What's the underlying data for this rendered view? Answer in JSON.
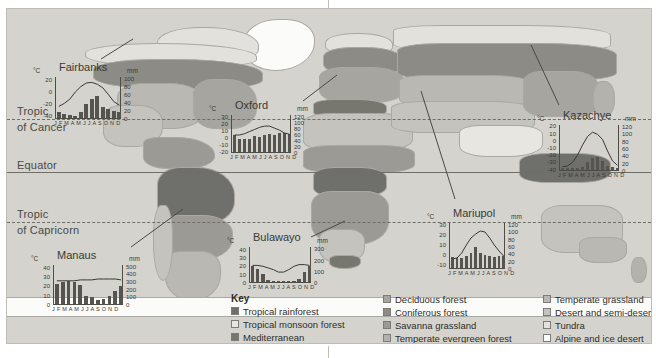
{
  "figure": {
    "background_color": "#d9d8d3",
    "latitude_labels": [
      {
        "name": "tropic-of-cancer",
        "line1": "Tropic",
        "line2": "of Cancer"
      },
      {
        "name": "equator",
        "line1": "Equator",
        "line2": ""
      },
      {
        "name": "tropic-of-capricorn",
        "line1": "Tropic",
        "line2": "of Capricorn"
      }
    ]
  },
  "key": {
    "title": "Key",
    "columns": [
      [
        {
          "label": "Tropical rainforest",
          "color": "#6f6f6c"
        },
        {
          "label": "Tropical monsoon forest",
          "color": "#e7e6e1"
        },
        {
          "label": "Mediterranean",
          "color": "#77776f"
        }
      ],
      [
        {
          "label": "Deciduous forest",
          "color": "#a6a5a0"
        },
        {
          "label": "Coniferous forest",
          "color": "#8c8b86"
        },
        {
          "label": "Savanna grassland",
          "color": "#9b9a95"
        },
        {
          "label": "Temperate evergreen forest",
          "color": "#b3b2ad"
        }
      ],
      [
        {
          "label": "Temperate grassland",
          "color": "#b9b8b3"
        },
        {
          "label": "Desert and semi-desert",
          "color": "#c4c3be"
        },
        {
          "label": "Tundra",
          "color": "#e2e1dc"
        },
        {
          "label": "Alpine and ice desert",
          "color": "#fbfbf9"
        }
      ]
    ]
  },
  "chart_data": [
    {
      "name": "fairbanks",
      "type": "bar",
      "title": "Fairbanks",
      "ylabel": "°C",
      "ylabel_right": "mm",
      "categories": [
        "J",
        "F",
        "M",
        "A",
        "M",
        "J",
        "J",
        "A",
        "S",
        "O",
        "N",
        "D"
      ],
      "months_label": "J F M A M J J A S O N D",
      "temp_ticks": [
        20,
        0,
        -20,
        -40
      ],
      "temp_ylim": [
        -45,
        25
      ],
      "precip_ticks": [
        100,
        80,
        60,
        40,
        20,
        0
      ],
      "precip_ylim": [
        0,
        105
      ],
      "temperature": [
        -24,
        -19,
        -12,
        0,
        9,
        15,
        16,
        13,
        7,
        -4,
        -16,
        -22
      ],
      "precipitation": [
        14,
        10,
        8,
        6,
        15,
        35,
        47,
        55,
        28,
        22,
        17,
        15
      ]
    },
    {
      "name": "oxford",
      "type": "bar",
      "title": "Oxford",
      "ylabel": "°C",
      "ylabel_right": "mm",
      "categories": [
        "J",
        "F",
        "M",
        "A",
        "M",
        "J",
        "J",
        "A",
        "S",
        "O",
        "N",
        "D"
      ],
      "months_label": "J F M A M J J A S O N D",
      "temp_ticks": [
        30,
        20,
        10,
        0,
        -10,
        -20
      ],
      "temp_ylim": [
        -22,
        33
      ],
      "precip_ticks": [
        120,
        100,
        80,
        60,
        40,
        20,
        0
      ],
      "precip_ylim": [
        0,
        125
      ],
      "temperature": [
        4,
        4,
        6,
        9,
        12,
        15,
        17,
        17,
        14,
        11,
        7,
        5
      ],
      "precipitation": [
        56,
        42,
        43,
        44,
        52,
        50,
        55,
        58,
        55,
        61,
        62,
        58
      ]
    },
    {
      "name": "kazachye",
      "type": "bar",
      "title": "Kazachye",
      "ylabel": "°C",
      "ylabel_right": "mm",
      "categories": [
        "J",
        "F",
        "M",
        "A",
        "M",
        "J",
        "J",
        "A",
        "S",
        "O",
        "N",
        "D"
      ],
      "months_label": "J F M A M J J A S O N D",
      "temp_ticks": [
        20,
        10,
        0,
        -10,
        -20,
        -30,
        -40
      ],
      "temp_ylim": [
        -42,
        22
      ],
      "precip_ticks": [
        120,
        100,
        80,
        60,
        40,
        20,
        0
      ],
      "precip_ylim": [
        0,
        125
      ],
      "temperature": [
        -36,
        -35,
        -30,
        -20,
        -6,
        6,
        12,
        9,
        2,
        -14,
        -28,
        -34
      ],
      "precipitation": [
        6,
        5,
        5,
        6,
        8,
        22,
        33,
        36,
        24,
        12,
        8,
        6
      ]
    },
    {
      "name": "mariupol",
      "type": "bar",
      "title": "Mariupol",
      "ylabel": "°C",
      "ylabel_right": "mm",
      "categories": [
        "J",
        "F",
        "M",
        "A",
        "M",
        "J",
        "J",
        "A",
        "S",
        "O",
        "N",
        "D"
      ],
      "months_label": "J F M A M J J A S O N D",
      "temp_ticks": [
        30,
        20,
        10,
        0,
        -10
      ],
      "temp_ylim": [
        -14,
        32
      ],
      "precip_ticks": [
        120,
        100,
        80,
        60,
        40,
        20,
        0
      ],
      "precip_ylim": [
        0,
        125
      ],
      "temperature": [
        -4,
        -3,
        2,
        10,
        17,
        21,
        24,
        23,
        17,
        10,
        4,
        -1
      ],
      "precipitation": [
        30,
        26,
        28,
        32,
        41,
        57,
        40,
        36,
        32,
        30,
        34,
        33
      ]
    },
    {
      "name": "bulawayo",
      "type": "bar",
      "title": "Bulawayo",
      "ylabel": "°C",
      "ylabel_right": "mm",
      "categories": [
        "J",
        "F",
        "M",
        "A",
        "M",
        "J",
        "J",
        "A",
        "S",
        "O",
        "N",
        "D"
      ],
      "months_label": "J F M A M J J A S O N D",
      "temp_ticks": [
        40,
        30,
        20,
        10,
        0
      ],
      "temp_ylim": [
        0,
        43
      ],
      "precip_ticks": [
        300,
        200,
        100,
        0
      ],
      "precip_ylim": [
        0,
        320
      ],
      "temperature": [
        21,
        21,
        20,
        18,
        16,
        13,
        13,
        16,
        20,
        22,
        22,
        21
      ],
      "precipitation": [
        145,
        120,
        75,
        20,
        8,
        3,
        1,
        2,
        8,
        30,
        90,
        140
      ]
    },
    {
      "name": "manaus",
      "type": "bar",
      "title": "Manaus",
      "ylabel": "°C",
      "ylabel_right": "mm",
      "categories": [
        "J",
        "F",
        "M",
        "A",
        "M",
        "J",
        "J",
        "A",
        "S",
        "O",
        "N",
        "D"
      ],
      "months_label": "J F M A M J J A S O N D",
      "temp_ticks": [
        40,
        30,
        20,
        10,
        0
      ],
      "temp_ylim": [
        0,
        43
      ],
      "precip_ticks": [
        500,
        400,
        300,
        200,
        100,
        0
      ],
      "precip_ylim": [
        0,
        520
      ],
      "temperature": [
        26,
        26,
        26,
        26,
        27,
        27,
        27,
        28,
        28,
        28,
        28,
        27
      ],
      "precipitation": [
        260,
        280,
        300,
        290,
        250,
        110,
        85,
        50,
        70,
        110,
        170,
        230
      ]
    }
  ]
}
